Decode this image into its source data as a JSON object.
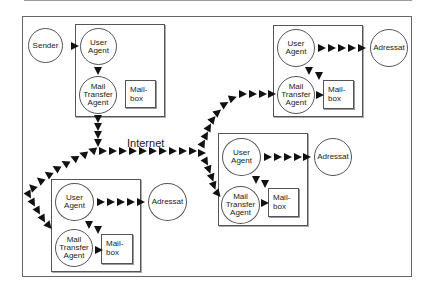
{
  "diagram": {
    "internet_label": "Internet",
    "sender": {
      "label": "Sender"
    },
    "sender_host": {
      "user_agent": "User\nAgent",
      "mta": "Mail\nTransfer\nAgent",
      "mailbox": "Mail-\nbox"
    },
    "recipient_host_top_right": {
      "user_agent": "User\nAgent",
      "mta": "Mail\nTransfer\nAgent",
      "mailbox": "Mail-\nbox",
      "adressat": "Adressat"
    },
    "recipient_host_middle_right": {
      "user_agent": "User\nAgent",
      "mta": "Mail\nTransfer\nAgent",
      "mailbox": "Mail-\nbox",
      "adressat": "Adressat"
    },
    "recipient_host_bottom_left": {
      "user_agent": "User\nAgent",
      "mta": "Mail\nTransfer\nAgent",
      "mailbox": "Mail-\nbox",
      "adressat": "Adressat"
    },
    "colors": {
      "line": "#555555",
      "arrow": "#111111",
      "background": "#ffffff"
    }
  }
}
